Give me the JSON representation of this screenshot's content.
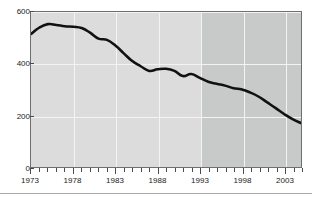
{
  "figure": {
    "title_remnant": "",
    "background": "#ffffff"
  },
  "axes": {
    "y_ticks": [
      0,
      200,
      400,
      600
    ],
    "y_min": 0,
    "y_max": 600,
    "x_min": 1973,
    "x_max": 2005,
    "x_labels": [
      1973,
      1978,
      1983,
      1988,
      1993,
      1998,
      2003
    ],
    "grid_color": "#f3f3f3",
    "axis_color": "#4a4a4a",
    "frame_color": "#6f6f6f"
  },
  "shading": {
    "early_region_color": "#dcdcdc",
    "late_region_color": "#c8c9c9",
    "late_region_start_year": 1993
  },
  "series_style": {
    "color": "#111111",
    "width_px": 2.6
  },
  "chart_data": {
    "type": "line",
    "title": "",
    "subtitle": "",
    "xlabel": "",
    "ylabel": "",
    "xlim": [
      1973,
      2005
    ],
    "ylim": [
      0,
      600
    ],
    "grid": true,
    "legend": "none",
    "annotations": [
      "Plot background is split into two shaded bands; the darker band covers 1993 onward."
    ],
    "series": [
      {
        "name": "Value",
        "x": [
          1973,
          1974,
          1975,
          1976,
          1977,
          1978,
          1979,
          1980,
          1981,
          1982,
          1983,
          1984,
          1985,
          1986,
          1987,
          1988,
          1989,
          1990,
          1991,
          1992,
          1993,
          1994,
          1995,
          1996,
          1997,
          1998,
          1999,
          2000,
          2001,
          2002,
          2003,
          2004,
          2005
        ],
        "values": [
          515,
          540,
          553,
          550,
          545,
          543,
          538,
          520,
          497,
          492,
          470,
          440,
          410,
          390,
          372,
          378,
          380,
          372,
          352,
          360,
          345,
          330,
          322,
          315,
          305,
          300,
          288,
          272,
          250,
          228,
          205,
          185,
          170
        ]
      }
    ]
  }
}
